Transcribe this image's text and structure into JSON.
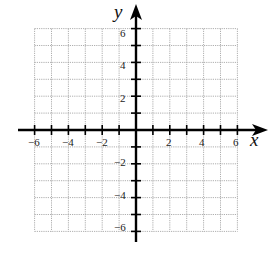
{
  "diagram": {
    "type": "coordinate-plane",
    "x_axis": {
      "label": "x",
      "min": -6,
      "max": 6,
      "tick_step": 1,
      "labeled_ticks": [
        -6,
        -4,
        -2,
        2,
        4,
        6
      ],
      "tick_labels": [
        "−6",
        "−4",
        "−2",
        "2",
        "4",
        "6"
      ]
    },
    "y_axis": {
      "label": "y",
      "min": -6,
      "max": 6,
      "tick_step": 1,
      "labeled_ticks": [
        6,
        4,
        2,
        -2,
        -4,
        -6
      ],
      "tick_labels": [
        "6",
        "4",
        "2",
        "−2",
        "−4",
        "−6"
      ]
    },
    "grid": {
      "on": true,
      "style": "dotted",
      "color": "#9a9a9a"
    },
    "axis_color": "#000000"
  }
}
